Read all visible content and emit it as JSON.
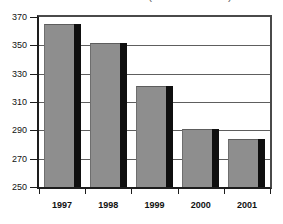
{
  "title_partial": "(million dollars)",
  "chart_data": {
    "type": "bar",
    "title": "(million dollars)",
    "xlabel": "",
    "ylabel": "",
    "categories": [
      "1997",
      "1998",
      "1999",
      "2000",
      "2001"
    ],
    "values": [
      365,
      352,
      321,
      291,
      284
    ],
    "ylim": [
      250,
      370
    ],
    "ytick_labels": [
      "250",
      "270",
      "290",
      "310",
      "330",
      "350",
      "370"
    ],
    "ytick_values": [
      250,
      270,
      290,
      310,
      330,
      350,
      370
    ],
    "grid": true,
    "legend": "none",
    "series": [
      {
        "name": "value",
        "values": [
          365,
          352,
          321,
          291,
          284
        ]
      }
    ],
    "colors": {
      "bar_face": "#8e8e8e",
      "bar_side": "#0f0f0f",
      "axis": "#1d1d1d",
      "gridline": "#5e5e5e",
      "background": "#ffffff",
      "text": "#111111",
      "title_text": "#6a6a6a"
    }
  }
}
